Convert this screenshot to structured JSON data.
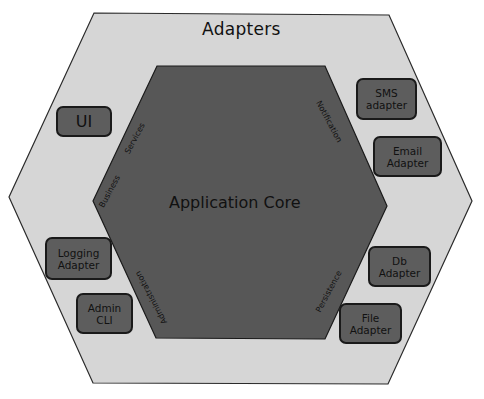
{
  "diagram": {
    "outer_label": "Adapters",
    "core_label": "Application Core",
    "colors": {
      "outer_fill": "#d6d6d6",
      "inner_fill": "#575757",
      "box_fill": "#5d5d5d",
      "stroke": "#1a1a1a",
      "text": "#111111"
    },
    "ports": [
      {
        "label": "Services"
      },
      {
        "label": "Business"
      },
      {
        "label": "Notification"
      },
      {
        "label": "Administration"
      },
      {
        "label": "Persistence"
      }
    ],
    "adapters": [
      {
        "label": "UI"
      },
      {
        "line1": "Logging",
        "line2": "Adapter"
      },
      {
        "line1": "Admin",
        "line2": "CLI"
      },
      {
        "line1": "SMS",
        "line2": "adapter"
      },
      {
        "line1": "Email",
        "line2": "Adapter"
      },
      {
        "line1": "Db",
        "line2": "Adapter"
      },
      {
        "line1": "File",
        "line2": "Adapter"
      }
    ]
  }
}
